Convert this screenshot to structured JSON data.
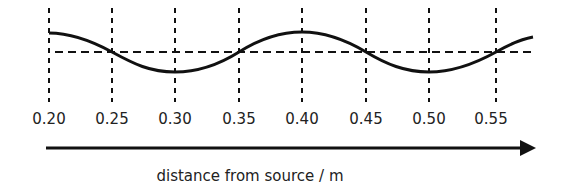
{
  "diagram": {
    "axis_label": "distance from source / m",
    "tick_labels": [
      "0.20",
      "0.25",
      "0.30",
      "0.35",
      "0.40",
      "0.45",
      "0.50",
      "0.55"
    ],
    "tick_x_px": [
      49,
      112,
      175,
      239,
      302,
      366,
      429,
      496
    ],
    "colors": {
      "line": "#111111",
      "text": "#222222",
      "background": "#ffffff"
    }
  }
}
